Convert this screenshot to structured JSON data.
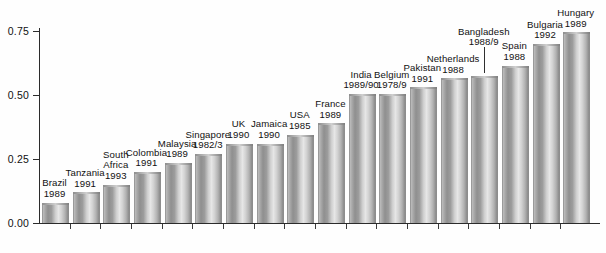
{
  "chart_data": {
    "type": "bar",
    "title": "",
    "subtitle": "",
    "xlabel": "",
    "ylabel": "",
    "ylim": [
      0.0,
      0.75
    ],
    "grid": false,
    "legend": null,
    "y_ticks": [
      "0.00",
      "0.25",
      "0.50",
      "0.75"
    ],
    "y_tick_values": [
      0.0,
      0.25,
      0.5,
      0.75
    ],
    "categories": [
      "Brazil",
      "Tanzania",
      "South Africa",
      "Colombia",
      "Malaysia",
      "Singapore",
      "UK",
      "Jamaica",
      "USA",
      "France",
      "India",
      "Belgium",
      "Pakistan",
      "Netherlands",
      "Bangladesh",
      "Spain",
      "Bulgaria",
      "Hungary"
    ],
    "values": [
      0.08,
      0.12,
      0.15,
      0.2,
      0.235,
      0.27,
      0.31,
      0.31,
      0.345,
      0.39,
      0.505,
      0.505,
      0.53,
      0.565,
      0.575,
      0.615,
      0.7,
      0.745
    ],
    "bars": [
      {
        "country": "Brazil",
        "year": "1989",
        "value": 0.08
      },
      {
        "country": "Tanzania",
        "year": "1991",
        "value": 0.12
      },
      {
        "country": "South Africa",
        "year": "1993",
        "value": 0.15
      },
      {
        "country": "Colombia",
        "year": "1991",
        "value": 0.2
      },
      {
        "country": "Malaysia",
        "year": "1989",
        "value": 0.235
      },
      {
        "country": "Singapore",
        "year": "1982/3",
        "value": 0.27
      },
      {
        "country": "UK",
        "year": "1990",
        "value": 0.31
      },
      {
        "country": "Jamaica",
        "year": "1990",
        "value": 0.31
      },
      {
        "country": "USA",
        "year": "1985",
        "value": 0.345
      },
      {
        "country": "France",
        "year": "1989",
        "value": 0.39
      },
      {
        "country": "India",
        "year": "1989/90",
        "value": 0.505
      },
      {
        "country": "Belgium",
        "year": "1978/9",
        "value": 0.505
      },
      {
        "country": "Pakistan",
        "year": "1991",
        "value": 0.53
      },
      {
        "country": "Netherlands",
        "year": "1988",
        "value": 0.565
      },
      {
        "country": "Bangladesh",
        "year": "1988/9",
        "value": 0.575
      },
      {
        "country": "Spain",
        "year": "1988",
        "value": 0.615
      },
      {
        "country": "Bulgaria",
        "year": "1992",
        "value": 0.7
      },
      {
        "country": "Hungary",
        "year": "1989",
        "value": 0.745
      }
    ]
  },
  "colors": {
    "axis": "#2b2b2b",
    "text": "#111111",
    "bar_light": "#e6e6e6",
    "bar_mid": "#b2b2b2",
    "bar_dark": "#8a8a8a",
    "background": "#ffffff"
  }
}
